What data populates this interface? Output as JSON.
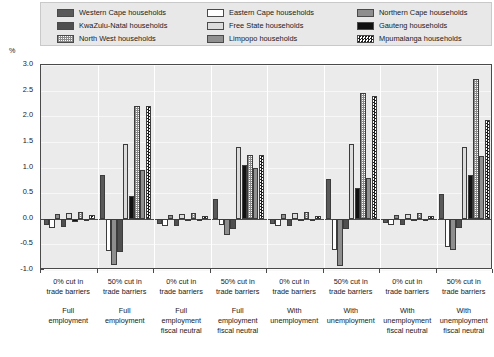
{
  "axis": {
    "ylabel": "%",
    "yticks": [
      "3.0",
      "2.5",
      "2.0",
      "1.5",
      "1.0",
      "0.5",
      "0.0",
      "-0.5",
      "-1.0"
    ],
    "ymin": -1.0,
    "ymax": 3.0
  },
  "legend": {
    "items": [
      {
        "label": "Western Cape households",
        "pattern": "f-darkgray",
        "icon": "legend-swatch-western-cape"
      },
      {
        "label": "Eastern Cape households",
        "pattern": "f-white",
        "icon": "legend-swatch-eastern-cape"
      },
      {
        "label": "Northern Cape households",
        "pattern": "f-medgray",
        "icon": "legend-swatch-northern-cape"
      },
      {
        "label": "KwaZulu-Natal households",
        "pattern": "f-dark2",
        "icon": "legend-swatch-kwazulu-natal"
      },
      {
        "label": "Free State households",
        "pattern": "f-lightgray",
        "icon": "legend-swatch-free-state"
      },
      {
        "label": "Gauteng households",
        "pattern": "f-black",
        "icon": "legend-swatch-gauteng"
      },
      {
        "label": "North West households",
        "pattern": "f-dots",
        "icon": "legend-swatch-north-west"
      },
      {
        "label": "Limpopo households",
        "pattern": "f-medgray2",
        "icon": "legend-swatch-limpopo"
      },
      {
        "label": "Mpumalanga households",
        "pattern": "f-check",
        "icon": "legend-swatch-mpumalanga"
      }
    ]
  },
  "chart_data": {
    "type": "bar",
    "title": "",
    "xlabel": "",
    "ylabel": "%",
    "ylim": [
      -1.0,
      3.0
    ],
    "grid": true,
    "legend_position": "top",
    "categories": [
      "0% cut in trade barriers",
      "50% cut in trade barriers",
      "0% cut in trade barriers",
      "50% cut in trade barriers",
      "0% cut in trade barriers",
      "50% cut in trade barriers",
      "0% cut in trade barriers",
      "50% cut in trade barriers"
    ],
    "scenarios": [
      "Full employment",
      "Full employment",
      "Full employment fiscal neutral",
      "Full employment fiscal neutral",
      "With unemployment",
      "With unemployment",
      "With unemployment fiscal neutral",
      "With unemployment fiscal neutral"
    ],
    "series": [
      {
        "name": "Western Cape households",
        "pattern": "f-darkgray",
        "values": [
          -0.12,
          0.85,
          -0.1,
          0.38,
          -0.1,
          0.78,
          -0.08,
          0.48
        ]
      },
      {
        "name": "Eastern Cape households",
        "pattern": "f-white",
        "values": [
          -0.18,
          -0.62,
          -0.15,
          -0.12,
          -0.14,
          -0.6,
          -0.12,
          -0.55
        ]
      },
      {
        "name": "Northern Cape households",
        "pattern": "f-medgray",
        "values": [
          0.1,
          -0.9,
          0.08,
          -0.32,
          0.1,
          -0.92,
          0.08,
          -0.6
        ]
      },
      {
        "name": "KwaZulu-Natal households",
        "pattern": "f-dark2",
        "values": [
          -0.16,
          -0.65,
          -0.14,
          -0.2,
          -0.14,
          -0.2,
          -0.12,
          -0.18
        ]
      },
      {
        "name": "Free State households",
        "pattern": "f-lightgray",
        "values": [
          0.12,
          1.45,
          0.1,
          1.4,
          0.12,
          1.45,
          0.1,
          1.4
        ]
      },
      {
        "name": "Gauteng households",
        "pattern": "f-black",
        "values": [
          -0.06,
          0.45,
          -0.05,
          1.05,
          -0.04,
          0.6,
          -0.04,
          0.85
        ]
      },
      {
        "name": "North West households",
        "pattern": "f-dots",
        "values": [
          0.14,
          2.2,
          0.12,
          1.25,
          0.14,
          2.45,
          0.12,
          2.72
        ]
      },
      {
        "name": "Limpopo households",
        "pattern": "f-medgray2",
        "values": [
          -0.05,
          0.95,
          -0.04,
          1.0,
          -0.04,
          0.8,
          -0.04,
          1.22
        ]
      },
      {
        "name": "Mpumalanga households",
        "pattern": "f-check",
        "values": [
          0.07,
          2.2,
          0.06,
          1.25,
          0.06,
          2.4,
          0.06,
          1.93
        ]
      }
    ]
  }
}
